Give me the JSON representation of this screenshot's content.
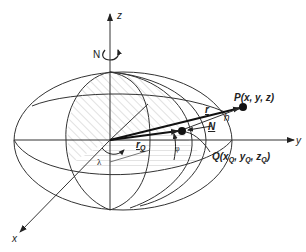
{
  "diagram": {
    "type": "geodetic-ellipsoid-coordinates",
    "axes": {
      "x": "x",
      "y": "y",
      "z": "z"
    },
    "labels": {
      "north": "N",
      "point_p": "P(x, y, z)",
      "point_q_prefix": "Q(x",
      "point_q_sub1": "Q",
      "point_q_mid1": ", y",
      "point_q_sub2": "Q",
      "point_q_mid2": ", z",
      "point_q_sub3": "Q",
      "point_q_suffix": ")",
      "vector_r": "r",
      "vector_rq": "r",
      "vector_rq_sub": "Q",
      "normal": "N",
      "height": "h",
      "longitude": "λ",
      "latitude": "φ"
    },
    "colors": {
      "line": "#333333",
      "hatch": "#bbbbbb",
      "background": "#ffffff"
    }
  }
}
